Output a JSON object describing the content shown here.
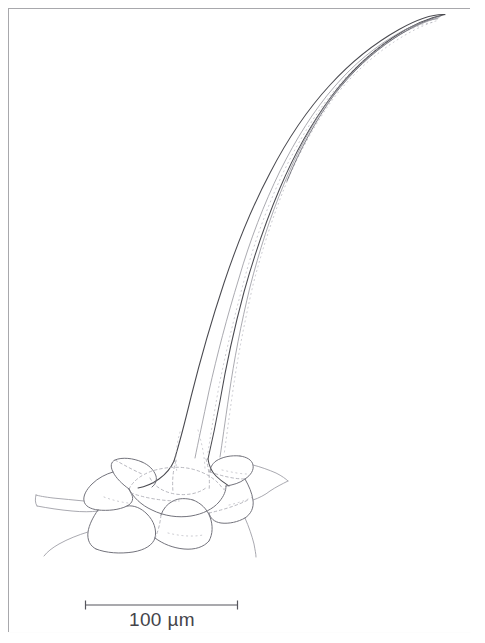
{
  "figure": {
    "kind": "scientific-line-drawing",
    "background_color": "#ffffff",
    "ink_color": "#4a4a50",
    "frame": {
      "present": true,
      "color": "#a8a8ac",
      "x": 8,
      "y": 8,
      "width": 463,
      "height": 625
    }
  },
  "scale_bar": {
    "label": "100 µm",
    "value": 100,
    "unit": "µm",
    "bar_left_x": 85,
    "bar_right_x": 238,
    "bar_y": 605,
    "pixel_length": 153,
    "tick_height": 9,
    "color": "#55555c"
  },
  "structures": {
    "shaft": {
      "name": "trichome shaft",
      "description": "long tapering curved hair, base at lower left, pointed tip at upper right",
      "base_x": 175,
      "base_y": 460,
      "tip_x": 445,
      "tip_y": 14,
      "outer_wall_lines": 2,
      "inner_lumen_lines": 2
    },
    "base": {
      "name": "flared trichome base",
      "description": "swollen pedestal seated in socket of epidermal cells",
      "center_x": 178,
      "center_y": 478
    },
    "epidermis": {
      "name": "epidermal cell rosette",
      "description": "ring of polygonal epidermal cells radiating around trichome base",
      "cell_count": 9,
      "extent_left_x": 36,
      "extent_right_x": 268,
      "extent_top_y": 455,
      "extent_bottom_y": 556
    }
  }
}
